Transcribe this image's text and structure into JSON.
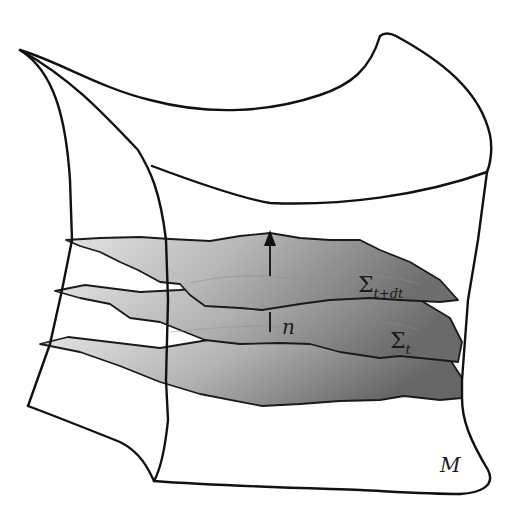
{
  "figure": {
    "labels": {
      "manifold": "M",
      "normal": "n",
      "hypersurface_lower": {
        "base": "Σ",
        "subscript": "t"
      },
      "hypersurface_upper": {
        "base": "Σ",
        "subscript": "t+dt"
      }
    },
    "colors": {
      "outline": "#111111",
      "layer_light": "#d6d6d6",
      "layer_dark": "#7a7a7a",
      "background": "#ffffff"
    },
    "layers": [
      "top-slice",
      "Σ_t+dt",
      "Σ_t",
      "bottom-slice"
    ],
    "arrow": {
      "name": "normal-vector",
      "direction": "up"
    }
  }
}
